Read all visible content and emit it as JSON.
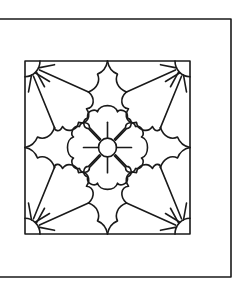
{
  "artwork": {
    "type": "line-art tile pattern",
    "colors": {
      "stroke": "#1a1a1a",
      "background": "#ffffff"
    },
    "outer_frame": {
      "left": 0,
      "top": 19,
      "right": 231,
      "bottom": 277
    },
    "inner_square": {
      "left": 25,
      "top": 61,
      "right": 190,
      "bottom": 234
    },
    "center": {
      "x": 107.5,
      "y": 147.5
    },
    "elements": [
      "corner-sunburst-top-left",
      "corner-sunburst-top-right",
      "corner-sunburst-bottom-left",
      "corner-sunburst-bottom-right",
      "scalloped-star",
      "center-flower",
      "center-circle"
    ]
  }
}
